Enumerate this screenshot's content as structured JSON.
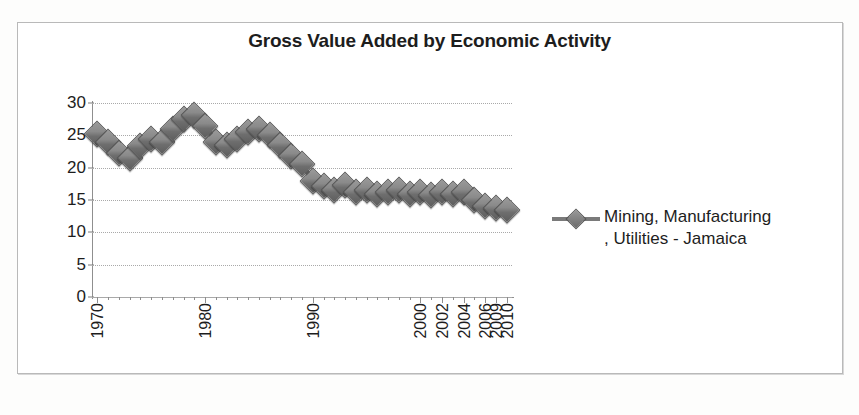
{
  "chart_data": {
    "type": "line",
    "title": "Gross Value Added by Economic Activity",
    "xlabel": "",
    "ylabel": "",
    "ylim": [
      0,
      30
    ],
    "ytick_labels": [
      "30",
      "25",
      "20",
      "15",
      "10",
      "5",
      "0"
    ],
    "ytick_values": [
      30,
      25,
      20,
      15,
      10,
      5,
      0
    ],
    "grid": true,
    "legend_position": "right",
    "marker": "diamond",
    "series": [
      {
        "name": "Mining, Manufacturing , Utilities - Jamaica",
        "values": [
          25.2,
          24.0,
          22.3,
          21.5,
          23.3,
          24.5,
          24.0,
          26.0,
          27.5,
          28.2,
          26.5,
          24.0,
          23.5,
          24.5,
          25.5,
          26.0,
          25.0,
          23.5,
          21.8,
          20.5,
          18.0,
          17.2,
          16.5,
          17.3,
          16.3,
          16.5,
          16.0,
          16.2,
          16.5,
          16.0,
          16.3,
          15.8,
          16.2,
          15.9,
          16.2,
          15.0,
          14.0,
          13.8,
          13.5
        ]
      }
    ],
    "x_categories": [
      "1970",
      "1971",
      "1972",
      "1973",
      "1974",
      "1975",
      "1976",
      "1977",
      "1978",
      "1979",
      "1980",
      "1981",
      "1982",
      "1983",
      "1984",
      "1985",
      "1986",
      "1987",
      "1988",
      "1989",
      "1990",
      "1991",
      "1992",
      "1993",
      "1994",
      "1995",
      "1996",
      "1997",
      "1998",
      "1999",
      "2000",
      "2001",
      "2002",
      "2003",
      "2004",
      "2005",
      "2006",
      "2009",
      "2010"
    ],
    "xtick_labels": [
      "1970",
      "1980",
      "1990",
      "2000",
      "2002",
      "2004",
      "2006",
      "2009",
      "2010"
    ],
    "xtick_indices": [
      0,
      10,
      20,
      30,
      32,
      34,
      36,
      37,
      38
    ]
  },
  "legend": {
    "line1": "Mining, Manufacturing",
    "line2": ", Utilities - Jamaica"
  },
  "caption": {
    "text": ""
  },
  "colors": {
    "series": "#7a7a7a",
    "marker_border": "#565656",
    "grid": "#a9a9a9",
    "axis": "#8f8f8f",
    "text": "#1d1d1d"
  }
}
